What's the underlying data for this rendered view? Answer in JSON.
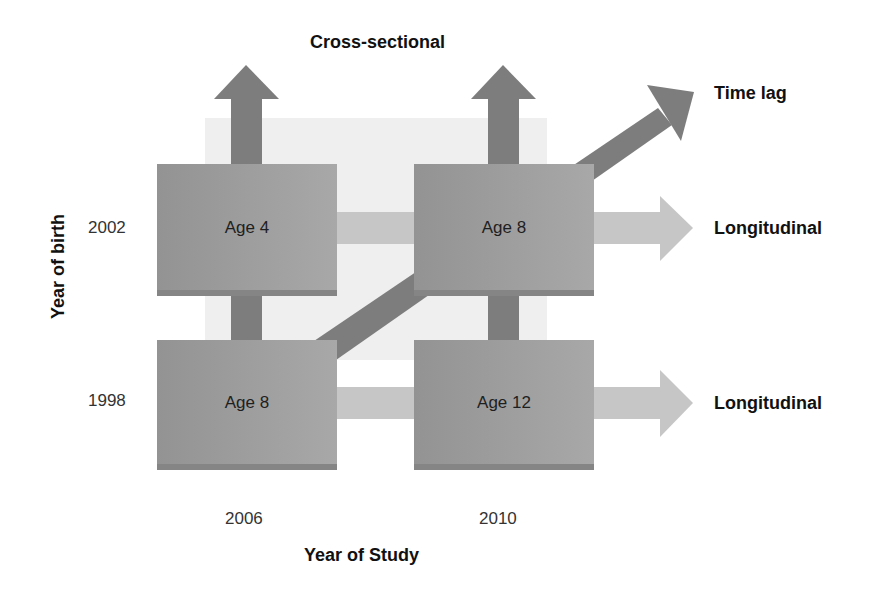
{
  "title": "Cross-sectional",
  "labels": {
    "cross_sectional": "Cross-sectional",
    "time_lag": "Time lag",
    "longitudinal_top": "Longitudinal",
    "longitudinal_bottom": "Longitudinal",
    "y_axis": "Year of birth",
    "x_axis": "Year of Study"
  },
  "y_ticks": [
    "2002",
    "1998"
  ],
  "x_ticks": [
    "2006",
    "2010"
  ],
  "boxes": [
    {
      "label": "Age 4",
      "birth_year": "2002",
      "study_year": "2006"
    },
    {
      "label": "Age 8",
      "birth_year": "2002",
      "study_year": "2010"
    },
    {
      "label": "Age 8",
      "birth_year": "1998",
      "study_year": "2006"
    },
    {
      "label": "Age 12",
      "birth_year": "1998",
      "study_year": "2010"
    }
  ],
  "colors": {
    "box": "#9a9a9a",
    "box_shadow": "#858585",
    "dark_arrow": "#7d7d7d",
    "light_arrow": "#c6c6c6",
    "background_square": "#efefef"
  }
}
